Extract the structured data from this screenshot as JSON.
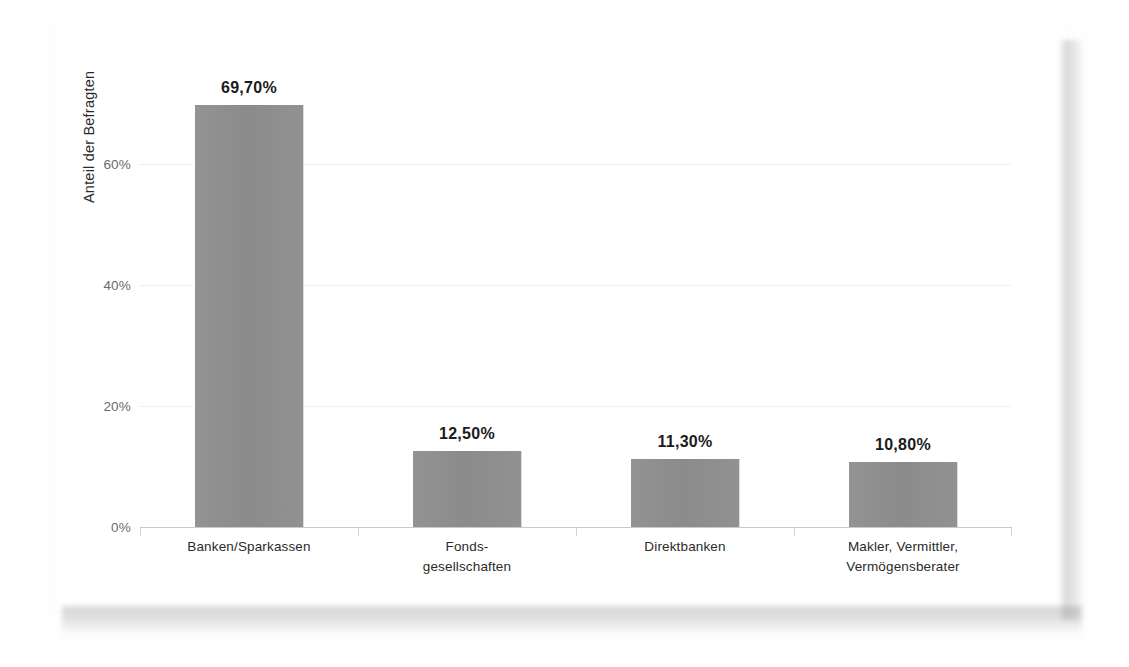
{
  "chart_data": {
    "type": "bar",
    "title": "",
    "subtitle": "",
    "xlabel": "",
    "ylabel": "Anteil der Befragten",
    "ylim": [
      0,
      70
    ],
    "yticks": [
      0,
      20,
      40,
      60
    ],
    "ytick_labels": [
      "0%",
      "20%",
      "40%",
      "60%"
    ],
    "grid": "horizontal-dotted",
    "legend": "none",
    "categories": [
      "Banken/Sparkassen",
      "Fonds-\ngesellschaften",
      "Direktbanken",
      "Makler, Vermittler,\nVermögensberater"
    ],
    "values": [
      69.7,
      12.5,
      11.3,
      10.8
    ],
    "data_labels": [
      "69,70%",
      "12,50%",
      "11,30%",
      "10,80%"
    ],
    "bar_color": "#8e8e8e",
    "axis_color": "#c9c9c9",
    "gridline_color": "#e3e3e3",
    "label_color": "#1b1b1b",
    "tick_color": "#6a6a6a"
  },
  "bars": [
    {
      "name": "banken-sparkassen",
      "label": "Banken/Sparkassen",
      "value": 69.7,
      "value_label": "69,70%"
    },
    {
      "name": "fondsgesellschaften",
      "label": "Fonds-\ngesellschaften",
      "value": 12.5,
      "value_label": "12,50%"
    },
    {
      "name": "direktbanken",
      "label": "Direktbanken",
      "value": 11.3,
      "value_label": "11,30%"
    },
    {
      "name": "makler",
      "label": "Makler, Vermittler,\nVermögensberater",
      "value": 10.8,
      "value_label": "10,80%"
    }
  ]
}
